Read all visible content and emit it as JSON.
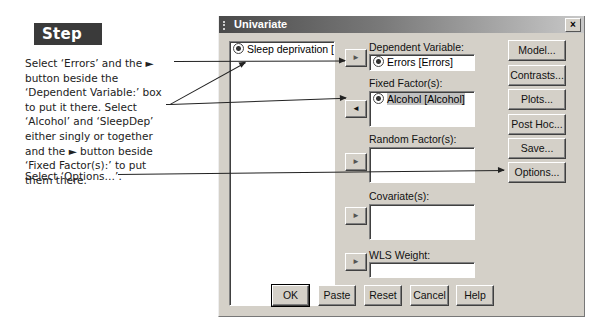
{
  "annotation": {
    "step_label": "Step 3:",
    "instruction_main": "Select ‘Errors’ and the ► button beside the ‘Dependent Variable:’ box to put it there. Select ‘Alcohol’ and ‘SleepDep’ either singly or together and the ► button beside ‘Fixed Factor(s):’ to put them there.",
    "instruction_options": "Select ‘Options…’."
  },
  "dialog": {
    "title": "Univariate",
    "close_glyph": "×",
    "variable_list": {
      "items": [
        {
          "label": "Sleep deprivation [Slee",
          "icon": "nominal-variable-icon"
        }
      ]
    },
    "dependent_variable": {
      "label": "Dependent Variable:",
      "value": "Errors [Errors]"
    },
    "fixed_factors": {
      "label": "Fixed Factor(s):",
      "items": [
        "Alcohol [Alcohol]"
      ]
    },
    "random_factors": {
      "label": "Random Factor(s):",
      "items": []
    },
    "covariates": {
      "label": "Covariate(s):",
      "items": []
    },
    "wls_weight": {
      "label": "WLS Weight:",
      "value": ""
    },
    "arrow_buttons": {
      "right": "►",
      "left": "◄"
    },
    "side_buttons": [
      "Model...",
      "Contrasts...",
      "Plots...",
      "Post Hoc...",
      "Save...",
      "Options..."
    ],
    "bottom_buttons": [
      "OK",
      "Paste",
      "Reset",
      "Cancel",
      "Help"
    ]
  }
}
